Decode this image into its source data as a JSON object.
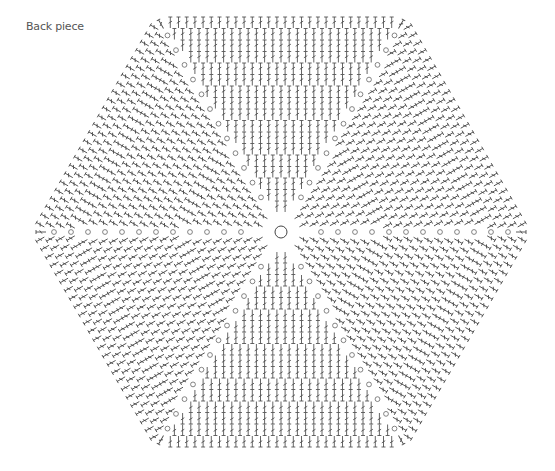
{
  "title": "Back piece",
  "diagram": {
    "type": "crochet-chart",
    "shape": "hexagon",
    "center": {
      "x": 281,
      "y": 232,
      "ring_radius": 6
    },
    "wedges": 6,
    "spokes": 6,
    "stitch_color": "#4a4a4a",
    "chain_color": "#666666",
    "background": "#ffffff",
    "legend": {
      "chain": "circle",
      "stitch": "tall stitch (treble)"
    },
    "vertices": [
      {
        "name": "left",
        "x": 34,
        "y": 232
      },
      {
        "name": "top-left",
        "x": 158,
        "y": 18
      },
      {
        "name": "top-right",
        "x": 403,
        "y": 18
      },
      {
        "name": "right",
        "x": 520,
        "y": 232
      },
      {
        "name": "bottom-right",
        "x": 405,
        "y": 447
      },
      {
        "name": "bottom-left",
        "x": 155,
        "y": 447
      }
    ]
  }
}
